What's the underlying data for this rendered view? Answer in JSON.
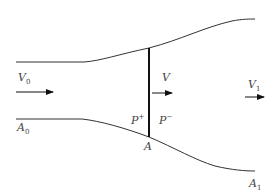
{
  "diagram": {
    "type": "nozzle-flow-schematic",
    "colors": {
      "wall": "#333333",
      "section": "#111111",
      "arrow": "#111111",
      "label": "#444444",
      "background": "#ffffff"
    },
    "labels": {
      "v0": {
        "base": "V",
        "sub": "0"
      },
      "a0": {
        "base": "A",
        "sub": "0"
      },
      "v": {
        "base": "V"
      },
      "p_plus": {
        "base": "P",
        "sup": "+"
      },
      "p_minus": {
        "base": "P",
        "sup": "−"
      },
      "a": {
        "base": "A"
      },
      "v1": {
        "base": "V",
        "sub": "1"
      },
      "a1": {
        "base": "A",
        "sub": "1"
      }
    },
    "arrows": [
      {
        "name": "inlet-flow",
        "x1": 16,
        "x2": 53,
        "y": 92
      },
      {
        "name": "section-flow",
        "x1": 152,
        "x2": 172,
        "y": 93
      },
      {
        "name": "outlet-flow",
        "x1": 245,
        "x2": 264,
        "y": 97
      }
    ]
  }
}
